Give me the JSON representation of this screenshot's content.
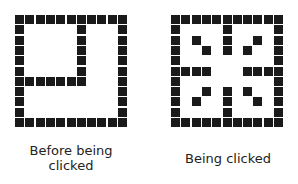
{
  "figures": [
    {
      "id": "before",
      "label_lines": [
        "Before being",
        "clicked"
      ],
      "grid_size": 11,
      "cell_color": "#1a1a1a",
      "filled": [
        "XXXXXXXXXXX",
        "X.....X...X",
        "X.....X...X",
        "X.....X...X",
        "X.....X...X",
        "X.....X...X",
        "XXXXXXX...X",
        "X.........X",
        "X.........X",
        "X.........X",
        "XXXXXXXXXXX"
      ]
    },
    {
      "id": "clicked",
      "label_lines": [
        "Being clicked"
      ],
      "grid_size": 11,
      "cell_color": "#1a1a1a",
      "filled": [
        "XXXXXXXXXXX",
        "X....X....X",
        "X.X..X..X.X",
        "X..X.X.X..X",
        "X.........X",
        "XXXX...XXXX",
        "X.........X",
        "X..X.X.X..X",
        "X.X..X..X.X",
        "X....X....X",
        "XXXXXXXXXXX"
      ]
    }
  ],
  "labels": {
    "before_line1": "Before being",
    "before_line2": "clicked",
    "clicked": "Being clicked"
  }
}
